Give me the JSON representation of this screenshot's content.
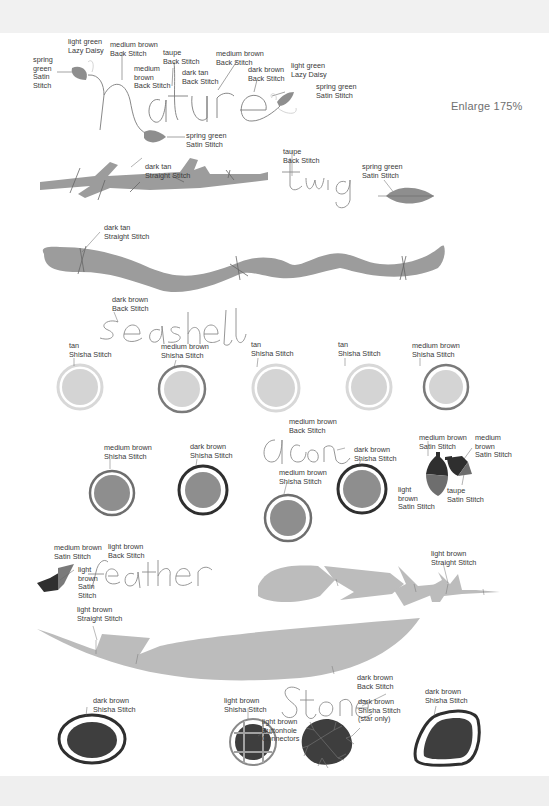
{
  "enlarge_note": "Enlarge 175%",
  "colors": {
    "spring_green": "#8a8a8a",
    "tan_fill": "#d6d6d6",
    "tan_ring": "#dcdcdc",
    "medium_brown": "#6e6e6e",
    "dark_brown": "#2f2f2f",
    "light_brown": "#bdbdbd",
    "twig_fill": "#9c9c9c",
    "feather_fill": "#bcbcbc",
    "stone_fill": "#3e3e3e",
    "text": "#3a3a3a"
  },
  "motifs": {
    "nature": {
      "word": "nature",
      "labels": [
        {
          "id": "spring-green-satin-left",
          "text": "spring\ngreen\nSatin\nStitch"
        },
        {
          "id": "light-green-lazy-daisy-left",
          "text": "light green\nLazy Daisy"
        },
        {
          "id": "medium-brown-back-stitch-1",
          "text": "medium brown\nBack Stitch"
        },
        {
          "id": "medium-brown-back-stitch-2",
          "text": "medium\nbrown\nBack Stitch"
        },
        {
          "id": "taupe-back-stitch",
          "text": "taupe\nBack Stitch"
        },
        {
          "id": "dark-tan-back-stitch",
          "text": "dark tan\nBack Stitch"
        },
        {
          "id": "medium-brown-back-stitch-3",
          "text": "medium brown\nBack Stitch"
        },
        {
          "id": "dark-brown-back-stitch",
          "text": "dark brown\nBack Stitch"
        },
        {
          "id": "light-green-lazy-daisy-right",
          "text": "light green\nLazy Daisy"
        },
        {
          "id": "spring-green-satin-right",
          "text": "spring green\nSatin Stitch"
        },
        {
          "id": "spring-green-satin-bottom",
          "text": "spring green\nSatin Stitch"
        }
      ]
    },
    "twig": {
      "word": "twig",
      "labels": [
        {
          "id": "dark-tan-straight",
          "text": "dark tan\nStraight Stitch"
        },
        {
          "id": "taupe-back-stitch",
          "text": "taupe\nBack Stitch"
        },
        {
          "id": "spring-green-satin",
          "text": "spring green\nSatin Stitch"
        }
      ]
    },
    "branch": {
      "labels": [
        {
          "id": "dark-tan-straight",
          "text": "dark tan\nStraight Stitch"
        }
      ]
    },
    "seashell": {
      "word": "seashell",
      "labels": [
        {
          "id": "dark-brown-back-stitch",
          "text": "dark brown\nBack Stitch"
        },
        {
          "id": "shell-1",
          "text": "tan\nShisha Stitch"
        },
        {
          "id": "shell-2",
          "text": "medium brown\nShisha Stitch"
        },
        {
          "id": "shell-3",
          "text": "tan\nShisha Stitch"
        },
        {
          "id": "shell-4",
          "text": "tan\nShisha Stitch"
        },
        {
          "id": "shell-5",
          "text": "medium brown\nShisha Stitch"
        }
      ]
    },
    "acorn": {
      "word": "acorn",
      "labels": [
        {
          "id": "circle-1",
          "text": "medium brown\nShisha Stitch"
        },
        {
          "id": "circle-2",
          "text": "dark brown\nShisha Stitch"
        },
        {
          "id": "back-stitch",
          "text": "medium brown\nBack Stitch"
        },
        {
          "id": "circle-3",
          "text": "medium brown\nShisha Stitch"
        },
        {
          "id": "circle-4",
          "text": "dark brown\nShisha Stitch"
        },
        {
          "id": "cap-left",
          "text": "medium brown\nSatin Stitch"
        },
        {
          "id": "cap-right",
          "text": "medium\nbrown\nSatin Stitch"
        },
        {
          "id": "nut-left",
          "text": "light\nbrown\nSatin Stitch"
        },
        {
          "id": "nut-right",
          "text": "taupe\nSatin Stitch"
        }
      ]
    },
    "feather": {
      "word": "feather",
      "labels": [
        {
          "id": "bird-dark",
          "text": "medium brown\nSatin Stitch"
        },
        {
          "id": "back-stitch",
          "text": "light brown\nBack Stitch"
        },
        {
          "id": "bird-light",
          "text": "light\nbrown\nSatin\nStitch"
        },
        {
          "id": "straight-top",
          "text": "light brown\nStraight Stitch"
        },
        {
          "id": "straight-bottom",
          "text": "light brown\nStraight Stitch"
        }
      ]
    },
    "stone": {
      "word": "Stone",
      "labels": [
        {
          "id": "stone-1",
          "text": "dark brown\nShisha Stitch"
        },
        {
          "id": "stone-2",
          "text": "light brown\nShisha Stitch"
        },
        {
          "id": "connectors",
          "text": "light brown\nButtonhole\nConnectors"
        },
        {
          "id": "back-stitch",
          "text": "dark brown\nBack Stitch"
        },
        {
          "id": "star",
          "text": "dark brown\nShisha Stitch\n(star only)"
        },
        {
          "id": "stone-4",
          "text": "dark brown\nShisha Stitch"
        }
      ]
    }
  }
}
